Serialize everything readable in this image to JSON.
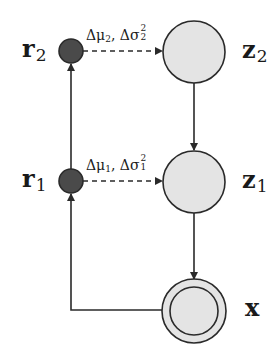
{
  "diagram": {
    "type": "graphical-model",
    "colors": {
      "latent_fill": "#e4e4e4",
      "residual_fill": "#4a4a4a",
      "stroke": "#2a2a2a",
      "background": "#ffffff"
    },
    "nodes": {
      "r2": {
        "symbol": "r",
        "subscript": "2",
        "kind": "residual"
      },
      "r1": {
        "symbol": "r",
        "subscript": "1",
        "kind": "residual"
      },
      "z2": {
        "symbol": "z",
        "subscript": "2",
        "kind": "latent"
      },
      "z1": {
        "symbol": "z",
        "subscript": "1",
        "kind": "latent"
      },
      "x": {
        "symbol": "x",
        "subscript": "",
        "kind": "observed"
      }
    },
    "edges": {
      "r2_to_z2": {
        "style": "dashed",
        "label": {
          "delta_mu": "Δμ",
          "mu_sub": "2",
          "sep": ", ",
          "delta_sigma": "Δσ",
          "sigma_sup": "2",
          "sigma_sub": "2"
        }
      },
      "r1_to_z1": {
        "style": "dashed",
        "label": {
          "delta_mu": "Δμ",
          "mu_sub": "1",
          "sep": ", ",
          "delta_sigma": "Δσ",
          "sigma_sup": "2",
          "sigma_sub": "1"
        }
      },
      "z2_to_z1": {
        "style": "solid"
      },
      "z1_to_x": {
        "style": "solid"
      },
      "r1_to_r2": {
        "style": "solid"
      },
      "x_to_r1": {
        "style": "solid"
      }
    }
  }
}
